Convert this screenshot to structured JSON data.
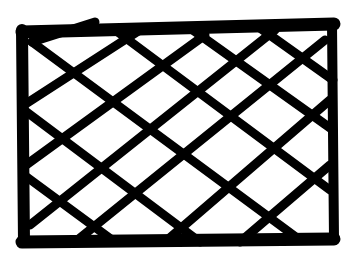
{
  "image": {
    "description": "Hand-drawn rectangle with diagonal crosshatch",
    "stroke_color": "#000000",
    "background_color": "#ffffff",
    "border": {
      "x1": 22,
      "y1": 30,
      "x2": 334,
      "y2": 242
    },
    "diagonals_down": [
      [
        [
          32,
          42
        ],
        [
          95,
          22
        ]
      ],
      [
        [
          24,
          105
        ],
        [
          140,
          30
        ]
      ],
      [
        [
          26,
          165
        ],
        [
          205,
          35
        ]
      ],
      [
        [
          30,
          225
        ],
        [
          275,
          30
        ]
      ],
      [
        [
          75,
          242
        ],
        [
          325,
          40
        ]
      ],
      [
        [
          165,
          242
        ],
        [
          330,
          100
        ]
      ],
      [
        [
          240,
          242
        ],
        [
          330,
          165
        ]
      ]
    ],
    "diagonals_up": [
      [
        [
          32,
          42
        ],
        [
          300,
          240
        ]
      ],
      [
        [
          115,
          30
        ],
        [
          330,
          190
        ]
      ],
      [
        [
          190,
          28
        ],
        [
          333,
          130
        ]
      ],
      [
        [
          260,
          28
        ],
        [
          333,
          80
        ]
      ],
      [
        [
          24,
          110
        ],
        [
          200,
          242
        ]
      ],
      [
        [
          24,
          175
        ],
        [
          115,
          242
        ]
      ]
    ]
  }
}
